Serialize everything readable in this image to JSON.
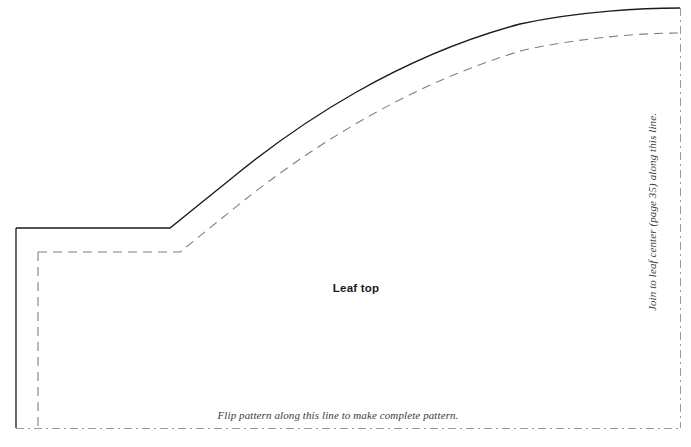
{
  "sheet": {
    "width": 691,
    "height": 447,
    "background_color": "#ffffff"
  },
  "pattern": {
    "piece_label": "Leaf top",
    "fold_instruction": "Flip pattern along this line to make complete pattern.",
    "join_instruction": "Join to leaf center (page 35) along this line.",
    "colors": {
      "cutting_line": "#1a1a1a",
      "seam_line": "#808080",
      "fold_line": "#9a9a9a",
      "label_text": "#1a1a1a",
      "instruction_text": "#3a3a3a"
    },
    "lines": {
      "cutting_line": {
        "name": "cutting-line",
        "style": "solid",
        "width": 1.3,
        "path": "M 16 228 L 170 228 L 232 178 C 300 122 400 56 520 24 C 580 11 645 8 680 8"
      },
      "cutting_line_left_edge": {
        "name": "cutting-line-left-edge",
        "style": "solid",
        "width": 1.3,
        "path": "M 16 228 L 16 428"
      },
      "seam_line": {
        "name": "seam-line",
        "style": "dashed",
        "width": 1.1,
        "dash_pattern": "9 6",
        "path": "M 38 252 L 180 252 L 242 202 C 310 148 408 84 524 50 C 584 37 646 33 678 33"
      },
      "seam_line_left_edge": {
        "name": "seam-line-left-edge",
        "style": "dashed",
        "width": 1.1,
        "dash_pattern": "9 6",
        "path": "M 38 252 L 38 428"
      },
      "fold_line_bottom": {
        "name": "fold-line-bottom",
        "style": "dash-dot",
        "width": 1,
        "dash_pattern": "8 4 2 4",
        "path": "M 16 428 L 680 428"
      },
      "fold_line_right": {
        "name": "fold-line-right",
        "style": "dash-dot",
        "width": 1,
        "dash_pattern": "8 4 2 4",
        "path": "M 680 8 L 680 428"
      }
    }
  }
}
